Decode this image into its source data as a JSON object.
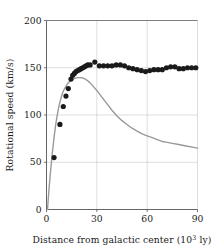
{
  "chart_data": {
    "type": "scatter",
    "title": "",
    "xlabel": "Distance from galactic center (10³ ly)",
    "xlabel_main": "Distance from galactic center (10",
    "xlabel_exp": "3",
    "xlabel_tail": " ly)",
    "ylabel": "Rotational speed (km/s)",
    "xlim": [
      0,
      90
    ],
    "ylim": [
      0,
      200
    ],
    "xticks": [
      0,
      30,
      60,
      90
    ],
    "xticklabels": [
      "0",
      "30",
      "60",
      "90"
    ],
    "yticks": [
      0,
      50,
      100,
      150,
      200
    ],
    "yticklabels": [
      "0",
      "50",
      "100",
      "150",
      "200"
    ],
    "grid": true,
    "grid_color": "#c8c8c8",
    "axis_color": "#555555",
    "legend": "none",
    "series": [
      {
        "name": "observed rotational speed",
        "type": "scatter",
        "marker": "filled-circle",
        "color": "#1a1a1a",
        "marker_size": 2.6,
        "points": [
          [
            4.5,
            55
          ],
          [
            8.0,
            90
          ],
          [
            10.0,
            109
          ],
          [
            11.6,
            120
          ],
          [
            13.0,
            128
          ],
          [
            14.6,
            138
          ],
          [
            15.6,
            142
          ],
          [
            16.6,
            144
          ],
          [
            17.6,
            146
          ],
          [
            18.6,
            147
          ],
          [
            19.6,
            148
          ],
          [
            20.6,
            149
          ],
          [
            21.6,
            150
          ],
          [
            22.6,
            151
          ],
          [
            23.6,
            152
          ],
          [
            24.6,
            153
          ],
          [
            26.0,
            153
          ],
          [
            28.8,
            156
          ],
          [
            31.5,
            152
          ],
          [
            34.0,
            152
          ],
          [
            36.5,
            152
          ],
          [
            39.0,
            152
          ],
          [
            41.5,
            153
          ],
          [
            44.0,
            153
          ],
          [
            46.5,
            152
          ],
          [
            49.0,
            150
          ],
          [
            51.5,
            149
          ],
          [
            54.0,
            148
          ],
          [
            56.5,
            147
          ],
          [
            59.0,
            146
          ],
          [
            61.5,
            147
          ],
          [
            64.0,
            148
          ],
          [
            66.5,
            148
          ],
          [
            69.0,
            148
          ],
          [
            71.5,
            150
          ],
          [
            74.0,
            151
          ],
          [
            76.5,
            151
          ],
          [
            79.0,
            149
          ],
          [
            81.5,
            149
          ],
          [
            84.0,
            150
          ],
          [
            86.5,
            150
          ],
          [
            89.0,
            150
          ]
        ]
      },
      {
        "name": "predicted keplerian curve",
        "type": "line",
        "color": "#999999",
        "line_width": 1.4,
        "points": [
          [
            0.6,
            0
          ],
          [
            1.5,
            22
          ],
          [
            2.5,
            42
          ],
          [
            3.5,
            60
          ],
          [
            4.5,
            76
          ],
          [
            5.5,
            90
          ],
          [
            6.5,
            101
          ],
          [
            7.5,
            110
          ],
          [
            8.5,
            117
          ],
          [
            9.5,
            123
          ],
          [
            10.5,
            127
          ],
          [
            11.5,
            130
          ],
          [
            12.5,
            133
          ],
          [
            13.5,
            135
          ],
          [
            14.5,
            136.5
          ],
          [
            15.5,
            137.8
          ],
          [
            16.5,
            138.6
          ],
          [
            17.5,
            139.2
          ],
          [
            18.5,
            139.5
          ],
          [
            19.5,
            139.6
          ],
          [
            20.5,
            139.5
          ],
          [
            21.5,
            139.2
          ],
          [
            22.5,
            138.5
          ],
          [
            24.0,
            137
          ],
          [
            26.0,
            134
          ],
          [
            28.0,
            130
          ],
          [
            30.0,
            126
          ],
          [
            33.0,
            119
          ],
          [
            36.0,
            112
          ],
          [
            39.0,
            105
          ],
          [
            42.0,
            99
          ],
          [
            45.0,
            94
          ],
          [
            48.0,
            90
          ],
          [
            51.0,
            86
          ],
          [
            54.0,
            83
          ],
          [
            57.0,
            80
          ],
          [
            60.0,
            78
          ],
          [
            63.0,
            76
          ],
          [
            66.0,
            74
          ],
          [
            69.0,
            72
          ],
          [
            72.0,
            71
          ],
          [
            75.0,
            70
          ],
          [
            78.0,
            69
          ],
          [
            81.0,
            68
          ],
          [
            84.0,
            67
          ],
          [
            87.0,
            66
          ],
          [
            90.0,
            65
          ]
        ]
      }
    ]
  }
}
